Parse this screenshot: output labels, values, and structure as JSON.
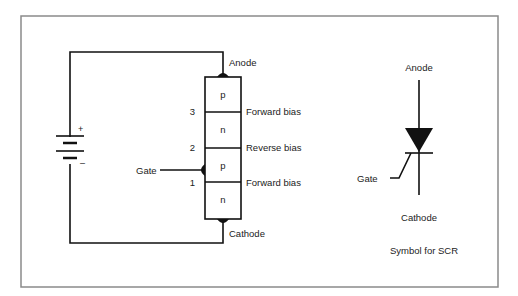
{
  "circuit": {
    "anode_label": "Anode",
    "cathode_label": "Cathode",
    "gate_label": "Gate",
    "battery_plus": "+",
    "battery_minus": "–",
    "layers": [
      "p",
      "n",
      "p",
      "n"
    ],
    "junctions": [
      {
        "number": "3",
        "bias": "Forward bias"
      },
      {
        "number": "2",
        "bias": "Reverse bias"
      },
      {
        "number": "1",
        "bias": "Forward bias"
      }
    ]
  },
  "symbol": {
    "anode_label": "Anode",
    "cathode_label": "Cathode",
    "gate_label": "Gate",
    "caption": "Symbol for SCR"
  },
  "colors": {
    "frame": "#8a8a8a",
    "line": "#111111",
    "text": "#222222"
  }
}
